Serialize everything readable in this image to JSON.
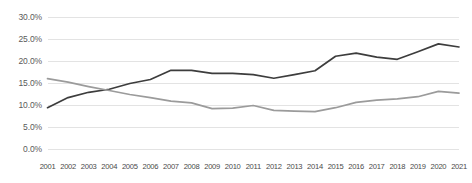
{
  "chart_data": {
    "type": "line",
    "title": "",
    "subtitle": "",
    "xlabel": "",
    "ylabel": "",
    "categories": [
      "2001",
      "2002",
      "2003",
      "2004",
      "2005",
      "2006",
      "2007",
      "2008",
      "2009",
      "2010",
      "2011",
      "2012",
      "2013",
      "2014",
      "2015",
      "2016",
      "2017",
      "2018",
      "2019",
      "2020",
      "2021"
    ],
    "ylim": [
      0,
      30
    ],
    "ytick_labels": [
      "30.0%",
      "25.0%",
      "20.0%",
      "15.0%",
      "10.0%",
      "5.0%",
      "0.0%"
    ],
    "ytick_values": [
      30,
      25,
      20,
      15,
      10,
      5,
      0
    ],
    "grid": "horizontal",
    "legend": "none",
    "series": [
      {
        "name": "dark-series",
        "color": "#3d3d3d",
        "values": [
          9.5,
          11.8,
          13.0,
          13.7,
          15.0,
          15.9,
          18.0,
          18.0,
          17.3,
          17.3,
          17.0,
          16.2,
          17.0,
          17.9,
          21.2,
          21.9,
          21.0,
          20.5,
          22.2,
          24.0,
          23.3
        ]
      },
      {
        "name": "gray-series",
        "color": "#9b9b9b",
        "values": [
          16.1,
          15.3,
          14.3,
          13.4,
          12.5,
          11.8,
          11.0,
          10.6,
          9.3,
          9.4,
          10.0,
          8.9,
          8.7,
          8.6,
          9.5,
          10.7,
          11.2,
          11.5,
          12.0,
          13.2,
          12.8
        ]
      }
    ]
  },
  "style": {
    "grid_color": "#e3e3e3",
    "axis_text_color": "#5a5a5a",
    "background": "#ffffff"
  }
}
